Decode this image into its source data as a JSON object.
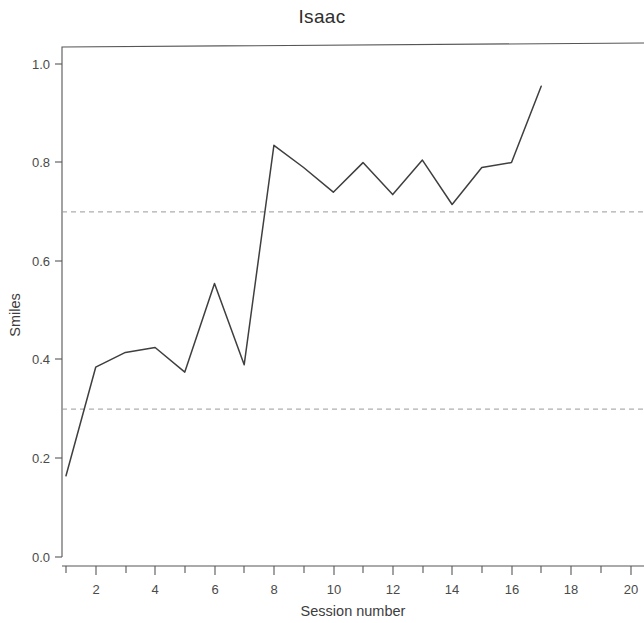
{
  "chart_data": {
    "type": "line",
    "title": "Isaac",
    "xlabel": "Session number",
    "ylabel": "Smiles",
    "x": [
      1,
      2,
      3,
      4,
      5,
      6,
      7,
      8,
      9,
      10,
      11,
      12,
      13,
      14,
      15,
      16,
      17
    ],
    "values": [
      0.165,
      0.385,
      0.415,
      0.425,
      0.375,
      0.555,
      0.39,
      0.835,
      0.79,
      0.74,
      0.8,
      0.735,
      0.805,
      0.715,
      0.79,
      0.8,
      0.955
    ],
    "series": [
      {
        "name": "Smiles",
        "values": [
          0.165,
          0.385,
          0.415,
          0.425,
          0.375,
          0.555,
          0.39,
          0.835,
          0.79,
          0.74,
          0.8,
          0.735,
          0.805,
          0.715,
          0.79,
          0.8,
          0.955
        ]
      }
    ],
    "xlim": [
      0.4,
      20.6
    ],
    "ylim": [
      0.0,
      1.06
    ],
    "xticks": [
      2,
      4,
      6,
      8,
      10,
      12,
      14,
      16,
      20
    ],
    "xtick_labels": [
      "2",
      "4",
      "6",
      "8",
      "10",
      "12",
      "14",
      "16",
      "18",
      "20"
    ],
    "xtick_values": [
      2,
      4,
      6,
      8,
      10,
      12,
      14,
      16,
      18,
      20
    ],
    "yticks": [
      0.0,
      0.2,
      0.4,
      0.6,
      0.8,
      1.0
    ],
    "ytick_labels": [
      "0.0",
      "0.2",
      "0.4",
      "0.6",
      "0.8",
      "1.0"
    ],
    "grid": false,
    "legend": "none",
    "reference_lines": [
      {
        "name": "upper-criterion",
        "value": 0.7,
        "style": "dashed"
      },
      {
        "name": "lower-criterion",
        "value": 0.3,
        "style": "dashed"
      }
    ],
    "line_color": "#3f3f3f",
    "reference_line_color": "#9a9a9a",
    "axis_color": "#565656",
    "background_color": "#ffffff"
  }
}
